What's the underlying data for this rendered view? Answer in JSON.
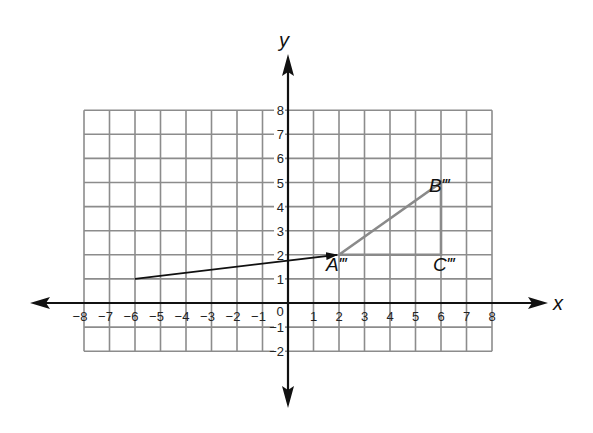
{
  "chart_data": {
    "type": "scatter",
    "title": "",
    "xlabel": "x",
    "ylabel": "y",
    "xlim": [
      -8,
      8
    ],
    "ylim": [
      -2,
      8
    ],
    "grid": true,
    "x_ticks": [
      "-8",
      "-7",
      "-6",
      "-5",
      "-4",
      "-3",
      "-2",
      "-1",
      "1",
      "2",
      "3",
      "4",
      "5",
      "6",
      "7",
      "8"
    ],
    "y_ticks": [
      "8",
      "7",
      "6",
      "5",
      "4",
      "3",
      "2",
      "1",
      "-1",
      "-2"
    ],
    "origin_label": "0",
    "points": [
      {
        "label": "A'''",
        "x": 2,
        "y": 2
      },
      {
        "label": "B'''",
        "x": 6,
        "y": 5
      },
      {
        "label": "C'''",
        "x": 6,
        "y": 2
      }
    ],
    "triangle": {
      "vertices": [
        "A'''",
        "B'''",
        "C'''"
      ],
      "color": "#8a8a8a"
    },
    "translation_arrow": {
      "from": [
        -6,
        1
      ],
      "to": [
        2,
        2
      ],
      "color": "#111111"
    }
  },
  "labels": {
    "x_axis": "x",
    "y_axis": "y",
    "origin": "0",
    "A": "A‴",
    "B": "B‴",
    "C": "C‴"
  }
}
